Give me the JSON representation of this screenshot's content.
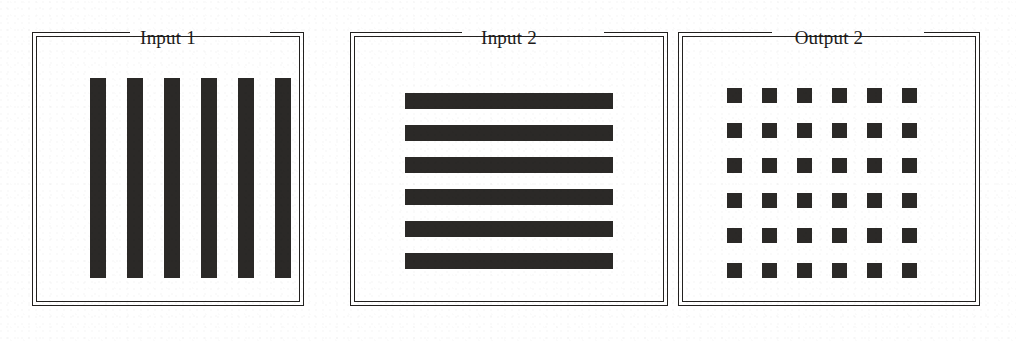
{
  "figure": {
    "background_color": "#ffffff",
    "ink_color": "#2b2927",
    "frame_color": "#23211f",
    "panels": [
      {
        "id": "input-1",
        "title": "Input 1",
        "pattern": "vertical-bars",
        "frame": {
          "x": 32,
          "y": 32,
          "width": 272,
          "height": 274
        },
        "title_notch": {
          "x": 98,
          "width": 140
        },
        "marks": [
          {
            "x": 53,
            "y": 41,
            "width": 16,
            "height": 200
          },
          {
            "x": 90,
            "y": 41,
            "width": 16,
            "height": 200
          },
          {
            "x": 127,
            "y": 41,
            "width": 16,
            "height": 200
          },
          {
            "x": 164,
            "y": 41,
            "width": 16,
            "height": 200
          },
          {
            "x": 201,
            "y": 41,
            "width": 16,
            "height": 200
          },
          {
            "x": 238,
            "y": 41,
            "width": 16,
            "height": 200
          }
        ]
      },
      {
        "id": "input-2",
        "title": "Input 2",
        "pattern": "horizontal-stripes",
        "frame": {
          "x": 350,
          "y": 32,
          "width": 318,
          "height": 274
        },
        "title_notch": {
          "x": 112,
          "width": 142
        },
        "marks": [
          {
            "x": 50,
            "y": 56,
            "width": 208,
            "height": 16
          },
          {
            "x": 50,
            "y": 88,
            "width": 208,
            "height": 16
          },
          {
            "x": 50,
            "y": 120,
            "width": 208,
            "height": 16
          },
          {
            "x": 50,
            "y": 152,
            "width": 208,
            "height": 16
          },
          {
            "x": 50,
            "y": 184,
            "width": 208,
            "height": 16
          },
          {
            "x": 50,
            "y": 216,
            "width": 208,
            "height": 16
          }
        ]
      },
      {
        "id": "output-2",
        "title": "Output 2",
        "pattern": "square-grid",
        "frame": {
          "x": 678,
          "y": 32,
          "width": 302,
          "height": 274
        },
        "title_notch": {
          "x": 94,
          "width": 152
        },
        "grid": {
          "rows": 6,
          "columns": 6,
          "cell_size": 15,
          "pitch_x": 35,
          "pitch_y": 35,
          "origin_x": 44,
          "origin_y": 51
        }
      }
    ]
  }
}
